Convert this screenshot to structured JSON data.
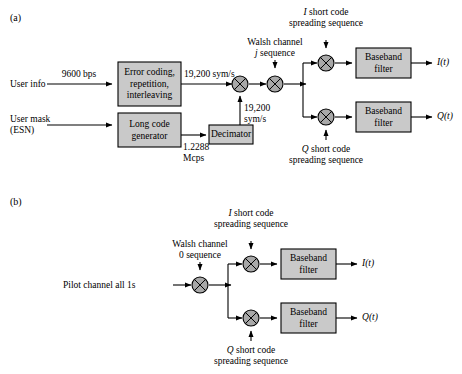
{
  "figure": {
    "type": "block-diagram",
    "colors": {
      "box_fill": "#c9c9c9",
      "box_stroke": "#000000",
      "multiplier_fill": "#a8a8a8",
      "line": "#000000",
      "background": "#ffffff"
    }
  },
  "panels": [
    {
      "tag": "(a)",
      "inputs": [
        {
          "name": "user-info",
          "label": "User info"
        },
        {
          "name": "user-mask",
          "label": "User mask\n(ESN)",
          "line1": "User mask",
          "line2": "(ESN)"
        }
      ],
      "rate_labels": [
        {
          "name": "rate-9600-bps",
          "text": "9600 bps"
        },
        {
          "name": "rate-19200-sym-s-top",
          "text": "19,200 sym/s"
        },
        {
          "name": "rate-19200-sym-s-mid-line1",
          "text": "19,200"
        },
        {
          "name": "rate-19200-sym-s-mid-line2",
          "text": "sym/s"
        },
        {
          "name": "rate-1-2288-mcps-line1",
          "text": "1.2288"
        },
        {
          "name": "rate-1-2288-mcps-line2",
          "text": "Mcps"
        }
      ],
      "blocks": [
        {
          "name": "error-coding-block",
          "lines": [
            "Error coding,",
            "repetition,",
            "interleaving"
          ]
        },
        {
          "name": "long-code-generator-block",
          "lines": [
            "Long code",
            "generator"
          ]
        },
        {
          "name": "decimator-block",
          "lines": [
            "Decimator"
          ]
        },
        {
          "name": "baseband-filter-i-block",
          "lines": [
            "Baseband",
            "filter"
          ]
        },
        {
          "name": "baseband-filter-q-block",
          "lines": [
            "Baseband",
            "filter"
          ]
        }
      ],
      "sequence_labels": [
        {
          "name": "walsh-channel-j-sequence",
          "line1": "Walsh channel",
          "line2_italic": "j",
          "line2_rest": " sequence"
        },
        {
          "name": "i-short-code-spreading-sequence",
          "line1_italic": "I",
          "line1_rest": " short code",
          "line2": "spreading sequence"
        },
        {
          "name": "q-short-code-spreading-sequence",
          "line1_italic": "Q",
          "line1_rest": " short code",
          "line2": "spreading sequence"
        }
      ],
      "outputs": [
        {
          "name": "output-i-t",
          "italic": "I",
          "rest": "(t)"
        },
        {
          "name": "output-q-t",
          "italic": "Q",
          "rest": "(t)"
        }
      ]
    },
    {
      "tag": "(b)",
      "inputs": [
        {
          "name": "pilot-channel-input",
          "label": "Pilot channel all 1s"
        }
      ],
      "blocks": [
        {
          "name": "baseband-filter-i-block",
          "lines": [
            "Baseband",
            "filter"
          ]
        },
        {
          "name": "baseband-filter-q-block",
          "lines": [
            "Baseband",
            "filter"
          ]
        }
      ],
      "sequence_labels": [
        {
          "name": "walsh-channel-0-sequence",
          "line1": "Walsh channel",
          "line2": "0 sequence"
        },
        {
          "name": "i-short-code-spreading-sequence",
          "line1_italic": "I",
          "line1_rest": " short code",
          "line2": "spreading sequence"
        },
        {
          "name": "q-short-code-spreading-sequence",
          "line1_italic": "Q",
          "line1_rest": " short code",
          "line2": "spreading sequence"
        }
      ],
      "outputs": [
        {
          "name": "output-i-t",
          "italic": "I",
          "rest": "(t)"
        },
        {
          "name": "output-q-t",
          "italic": "Q",
          "rest": "(t)"
        }
      ]
    }
  ]
}
